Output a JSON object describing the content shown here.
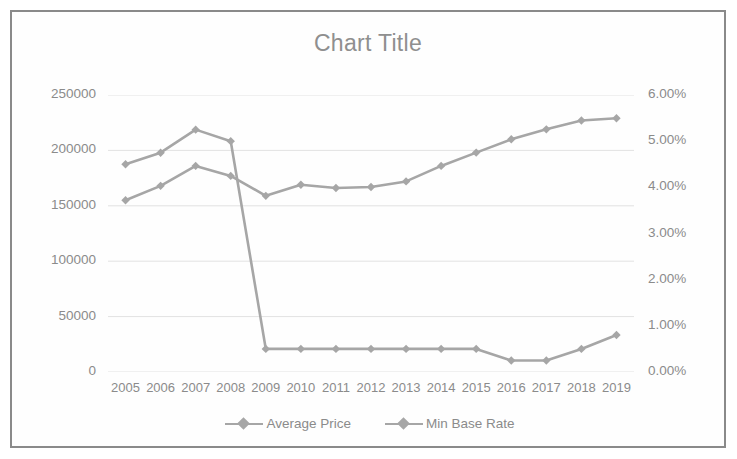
{
  "chart_data": {
    "type": "line",
    "title": "Chart Title",
    "xlabel": "",
    "ylabel": "",
    "categories": [
      "2005",
      "2006",
      "2007",
      "2008",
      "2009",
      "2010",
      "2011",
      "2012",
      "2013",
      "2014",
      "2015",
      "2016",
      "2017",
      "2018",
      "2019"
    ],
    "grid": true,
    "legend_position": "bottom",
    "axes": {
      "left": {
        "ticks": [
          "0",
          "50000",
          "100000",
          "150000",
          "200000",
          "250000"
        ],
        "values": [
          0,
          50000,
          100000,
          150000,
          200000,
          250000
        ],
        "ylim": [
          0,
          250000
        ],
        "format": "number"
      },
      "right": {
        "ticks": [
          "0.00%",
          "1.00%",
          "2.00%",
          "3.00%",
          "4.00%",
          "5.00%",
          "6.00%"
        ],
        "values": [
          0,
          1,
          2,
          3,
          4,
          5,
          6
        ],
        "ylim": [
          0,
          6
        ],
        "format": "percent"
      }
    },
    "series": [
      {
        "name": "Average Price",
        "axis": "left",
        "color": "#a6a6a6",
        "marker": "diamond",
        "values": [
          155000,
          168000,
          186000,
          177000,
          159000,
          169000,
          166000,
          167000,
          172000,
          186000,
          198000,
          210000,
          219000,
          227000,
          229000
        ]
      },
      {
        "name": "Min Base Rate",
        "axis": "right",
        "color": "#a6a6a6",
        "marker": "diamond",
        "values": [
          4.5,
          4.75,
          5.25,
          5.0,
          0.5,
          0.5,
          0.5,
          0.5,
          0.5,
          0.5,
          0.5,
          0.25,
          0.25,
          0.5,
          0.8
        ]
      }
    ]
  },
  "legend": {
    "items": [
      {
        "label": "Average Price"
      },
      {
        "label": "Min Base Rate"
      }
    ]
  },
  "colors": {
    "series": "#a6a6a6",
    "gridline": "#e2e2e2",
    "text": "#8b8b8b",
    "frame": "#8a8a8a",
    "background": "#ffffff"
  }
}
